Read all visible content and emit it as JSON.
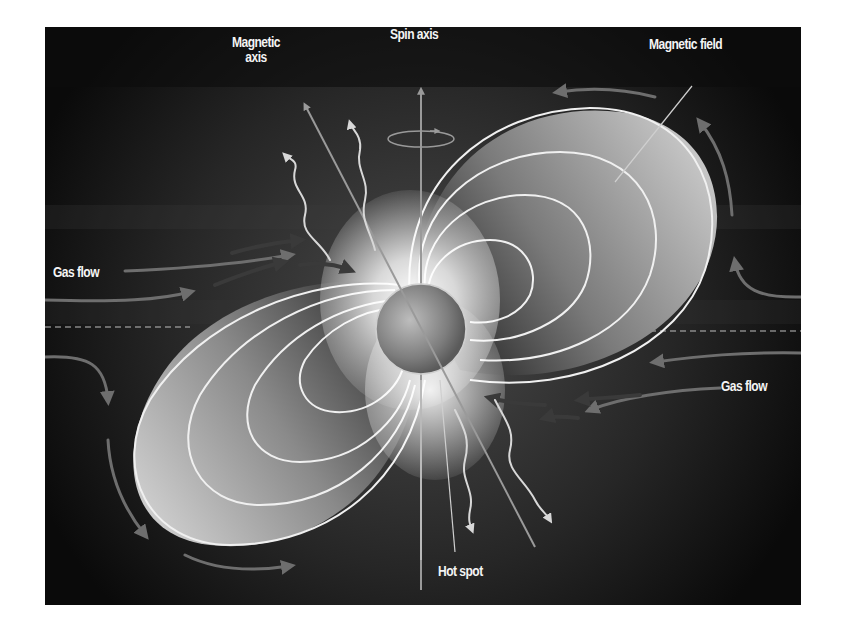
{
  "diagram": {
    "labels": {
      "magnetic_axis": "Magnetic\naxis",
      "magnetic_axis_line1": "Magnetic",
      "magnetic_axis_line2": "axis",
      "spin_axis": "Spin axis",
      "magnetic_field": "Magnetic field",
      "gas_flow_left": "Gas flow",
      "gas_flow_right": "Gas flow",
      "hot_spot": "Hot spot"
    },
    "elements": {
      "star": {
        "cx": 421,
        "cy": 329,
        "r": 45
      },
      "field_loops_per_lobe": 4,
      "lobes": [
        "upper-right",
        "lower-left"
      ],
      "emission_arrows": 4,
      "gas_flow_arrows_inner": 6
    },
    "colors": {
      "background": "#0b0b0b",
      "lobe_light": "#d9d9d9",
      "lobe_dark": "#555555",
      "field_line": "#f0f0f0",
      "gas_arrow": "#6e6e6e",
      "inner_arrow": "#3a3a3a",
      "label": "#f4f4f4"
    }
  }
}
